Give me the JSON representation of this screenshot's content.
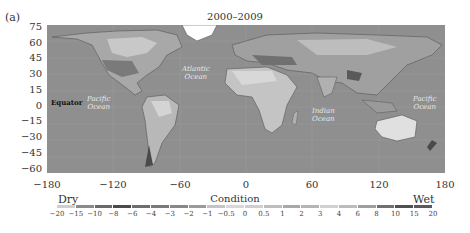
{
  "panel_label": "(a)",
  "title": "2000–2009",
  "map": {
    "x_ticks": [
      "−180",
      "−120",
      "−60",
      "0",
      "60",
      "120",
      "180"
    ],
    "y_ticks": [
      "75",
      "60",
      "45",
      "30",
      "15",
      "0",
      "−15",
      "−30",
      "−45",
      "−60"
    ],
    "labels": {
      "equator": "Equator",
      "pacific_west": [
        "Pacific",
        "Ocean"
      ],
      "atlantic": [
        "Atlantic",
        "Ocean"
      ],
      "indian": [
        "Indian",
        "Ocean"
      ],
      "pacific_east": [
        "Pacific",
        "Ocean"
      ]
    },
    "ocean_color": "#8f8f8f"
  },
  "colorbar": {
    "title": "Condition",
    "left_label": "Dry",
    "right_label": "Wet",
    "ticks": [
      "−20",
      "−15",
      "−10",
      "−8",
      "−6",
      "−4",
      "−3",
      "−2",
      "−1",
      "−0.5",
      "0",
      "0.5",
      "1",
      "2",
      "3",
      "4",
      "6",
      "8",
      "10",
      "15",
      "20"
    ],
    "segment_colors": [
      "#cfcfcf",
      "#8a8a8a",
      "#6a6a6a",
      "#4a4a4a",
      "#6e6e6e",
      "#7a7a7a",
      "#888888",
      "#9a9a9a",
      "#c4c4c4",
      "#d8d8d8",
      "#cfcfcf",
      "#bdbdbd",
      "#a8a8a8",
      "#b5b5b5",
      "#d0d0d0",
      "#bcbcbc",
      "#9e9e9e",
      "#707070",
      "#505050",
      "#5a5a5a"
    ]
  },
  "chart_data": {
    "type": "heatmap",
    "title": "2000–2009",
    "xlabel": "Longitude",
    "ylabel": "Latitude",
    "xlim": [
      -180,
      180
    ],
    "ylim": [
      -60,
      75
    ],
    "x_ticks": [
      -180,
      -120,
      -60,
      0,
      60,
      120,
      180
    ],
    "y_ticks": [
      75,
      60,
      45,
      30,
      15,
      0,
      -15,
      -30,
      -45,
      -60
    ],
    "colorbar": {
      "title": "Condition",
      "low_label": "Dry",
      "high_label": "Wet",
      "bounds": [
        -20,
        -15,
        -10,
        -8,
        -6,
        -4,
        -3,
        -2,
        -1,
        -0.5,
        0,
        0.5,
        1,
        2,
        3,
        4,
        6,
        8,
        10,
        15,
        20
      ]
    },
    "annotations": [
      "Equator",
      "Pacific Ocean",
      "Atlantic Ocean",
      "Indian Ocean",
      "Pacific Ocean"
    ],
    "panel": "(a)"
  }
}
